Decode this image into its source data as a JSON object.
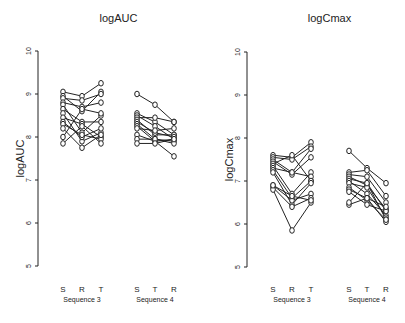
{
  "chart_data": [
    {
      "type": "line",
      "title": "logAUC",
      "xlabel": "",
      "ylabel": "logAUC",
      "ylim": [
        5,
        10
      ],
      "yticks": [
        5,
        6,
        7,
        8,
        9,
        10
      ],
      "grid": false,
      "legend": null,
      "groups": [
        {
          "name": "Sequence 3",
          "periods": [
            "S",
            "R",
            "T"
          ],
          "subjects": [
            [
              9.05,
              8.95,
              9.25
            ],
            [
              8.95,
              8.6,
              9.05
            ],
            [
              8.9,
              8.85,
              9.0
            ],
            [
              8.8,
              8.7,
              8.8
            ],
            [
              8.75,
              8.1,
              8.5
            ],
            [
              8.65,
              8.35,
              8.35
            ],
            [
              8.55,
              7.9,
              8.1
            ],
            [
              8.45,
              8.3,
              8.0
            ],
            [
              8.35,
              8.0,
              8.2
            ],
            [
              8.3,
              8.05,
              7.95
            ],
            [
              8.2,
              7.75,
              8.05
            ],
            [
              8.0,
              8.65,
              8.55
            ],
            [
              7.85,
              8.25,
              7.85
            ]
          ]
        },
        {
          "name": "Sequence 4",
          "periods": [
            "S",
            "T",
            "R"
          ],
          "subjects": [
            [
              9.0,
              8.75,
              8.35
            ],
            [
              8.55,
              8.35,
              8.05
            ],
            [
              8.5,
              8.25,
              7.95
            ],
            [
              8.45,
              8.45,
              8.35
            ],
            [
              8.4,
              8.05,
              8.05
            ],
            [
              8.35,
              8.1,
              8.0
            ],
            [
              8.3,
              7.95,
              7.9
            ],
            [
              8.25,
              7.9,
              7.95
            ],
            [
              8.2,
              8.15,
              8.2
            ],
            [
              8.05,
              7.9,
              7.55
            ],
            [
              7.95,
              7.95,
              7.85
            ],
            [
              7.85,
              7.85,
              7.95
            ]
          ]
        }
      ]
    },
    {
      "type": "line",
      "title": "logCmax",
      "xlabel": "",
      "ylabel": "logCmax",
      "ylim": [
        5,
        10
      ],
      "yticks": [
        5,
        6,
        7,
        8,
        9,
        10
      ],
      "grid": false,
      "legend": null,
      "groups": [
        {
          "name": "Sequence 3",
          "periods": [
            "S",
            "R",
            "T"
          ],
          "subjects": [
            [
              7.6,
              7.55,
              7.9
            ],
            [
              7.55,
              7.5,
              7.8
            ],
            [
              7.5,
              7.2,
              7.75
            ],
            [
              7.45,
              7.15,
              7.55
            ],
            [
              7.4,
              7.6,
              7.0
            ],
            [
              7.35,
              6.7,
              7.2
            ],
            [
              7.3,
              7.2,
              7.1
            ],
            [
              7.25,
              6.6,
              7.0
            ],
            [
              7.2,
              6.45,
              6.95
            ],
            [
              6.9,
              6.55,
              6.7
            ],
            [
              6.85,
              6.4,
              6.6
            ],
            [
              6.8,
              5.85,
              6.5
            ],
            [
              6.9,
              6.65,
              6.55
            ]
          ]
        },
        {
          "name": "Sequence 4",
          "periods": [
            "S",
            "T",
            "R"
          ],
          "subjects": [
            [
              7.7,
              7.3,
              6.95
            ],
            [
              7.2,
              7.25,
              6.65
            ],
            [
              7.15,
              7.1,
              6.5
            ],
            [
              7.1,
              6.9,
              6.35
            ],
            [
              7.05,
              6.95,
              6.3
            ],
            [
              7.0,
              6.7,
              6.2
            ],
            [
              6.95,
              6.85,
              6.15
            ],
            [
              6.85,
              6.55,
              6.1
            ],
            [
              6.8,
              6.6,
              6.05
            ],
            [
              6.75,
              6.45,
              6.3
            ],
            [
              6.45,
              6.6,
              6.4
            ],
            [
              6.5,
              6.95,
              6.1
            ]
          ]
        }
      ]
    }
  ],
  "panels": [
    {
      "title": "logAUC",
      "ylabel": "logAUC",
      "axis": {
        "x": 38,
        "y_top": 51,
        "y_bottom": 266
      },
      "groups": [
        {
          "label": "Sequence 3",
          "ticks": [
            "S",
            "R",
            "T"
          ],
          "xs": [
            63,
            82,
            101
          ],
          "label_x": 82
        },
        {
          "label": "Sequence 4",
          "ticks": [
            "S",
            "T",
            "R"
          ],
          "xs": [
            137,
            155,
            174
          ],
          "label_x": 155
        }
      ]
    },
    {
      "title": "logCmax",
      "ylabel": "logCmax",
      "axis": {
        "x": 247,
        "y_top": 52,
        "y_bottom": 267
      },
      "groups": [
        {
          "label": "Sequence 3",
          "ticks": [
            "S",
            "R",
            "T"
          ],
          "xs": [
            273,
            292,
            311
          ],
          "label_x": 292
        },
        {
          "label": "Sequence 4",
          "ticks": [
            "S",
            "T",
            "R"
          ],
          "xs": [
            349,
            367,
            386
          ],
          "label_x": 367
        }
      ]
    }
  ],
  "colors": {
    "ink": "#222222",
    "background": "#ffffff"
  }
}
